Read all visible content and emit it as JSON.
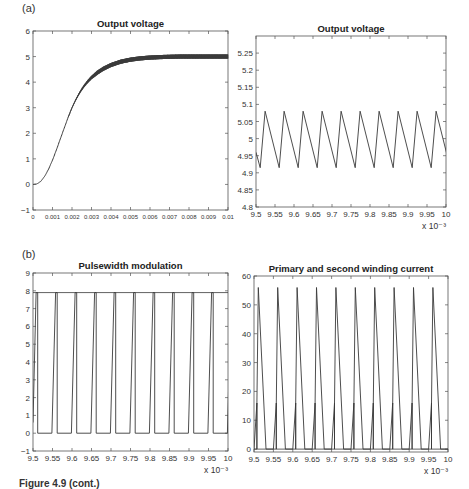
{
  "figure": {
    "panel_labels": [
      "(a)",
      "(b)"
    ],
    "caption": "Figure 4.9 (cont.)"
  },
  "chart_data": [
    {
      "id": "a-left",
      "type": "line",
      "title": "Output voltage",
      "xlabel": "",
      "ylabel": "",
      "xlim": [
        0,
        0.01
      ],
      "ylim": [
        -1,
        6
      ],
      "xticks": [
        0,
        0.001,
        0.002,
        0.003,
        0.004,
        0.005,
        0.006,
        0.007,
        0.008,
        0.009,
        0.01
      ],
      "xticklabels": [
        "0",
        "0.001",
        "0.002",
        "0.003",
        "0.004",
        "0.005",
        "0.006",
        "0.007",
        "0.008",
        "0.009",
        "0.01"
      ],
      "yticks": [
        -1,
        0,
        1,
        2,
        3,
        4,
        5,
        6
      ],
      "yticklabels": [
        "−1",
        "0",
        "1",
        "2",
        "3",
        "4",
        "5",
        "6"
      ],
      "x_exponent": "",
      "grid": false,
      "series": [
        {
          "name": "Output voltage",
          "x": [
            0,
            0.0002,
            0.0004,
            0.0006,
            0.0008,
            0.001,
            0.0012,
            0.0014,
            0.0016,
            0.0018,
            0.002,
            0.0022,
            0.0024,
            0.0026,
            0.0028,
            0.003,
            0.0033,
            0.0036,
            0.004,
            0.0045,
            0.005,
            0.0055,
            0.006,
            0.0065,
            0.007,
            0.0075,
            0.008,
            0.0085,
            0.009,
            0.0095,
            0.01
          ],
          "y": [
            0,
            0.02,
            0.12,
            0.32,
            0.6,
            0.95,
            1.35,
            1.78,
            2.2,
            2.62,
            3.0,
            3.32,
            3.6,
            3.83,
            4.02,
            4.18,
            4.37,
            4.52,
            4.67,
            4.8,
            4.88,
            4.93,
            4.96,
            4.98,
            4.99,
            5.0,
            5.0,
            5.0,
            5.0,
            5.0,
            5.0
          ],
          "ripple_band": 0.08
        }
      ]
    },
    {
      "id": "a-right",
      "type": "line",
      "title": "Output voltage",
      "xlim": [
        9.5,
        10
      ],
      "ylim": [
        4.8,
        5.3
      ],
      "xticks": [
        9.5,
        9.55,
        9.6,
        9.65,
        9.7,
        9.75,
        9.8,
        9.85,
        9.9,
        9.95,
        10
      ],
      "xticklabels": [
        "9.5",
        "9.55",
        "9.6",
        "9.65",
        "9.7",
        "9.75",
        "9.8",
        "9.85",
        "9.9",
        "9.95",
        "10"
      ],
      "yticks": [
        4.8,
        4.85,
        4.9,
        4.95,
        5,
        5.05,
        5.1,
        5.15,
        5.2,
        5.25
      ],
      "yticklabels": [
        "4.8",
        "4.85",
        "4.9",
        "4.95",
        "5",
        "5.05",
        "5.1",
        "5.15",
        "5.2",
        "5.25"
      ],
      "x_exponent": "x 10⁻³",
      "grid": false,
      "waveform": {
        "kind": "sawtooth",
        "period": 0.05,
        "min_x_offset": 0.011,
        "peak_x_offset": 0.024,
        "min": 4.915,
        "max": 5.08,
        "start_value": 4.96
      }
    },
    {
      "id": "b-left",
      "type": "line",
      "title": "Pulsewidth modulation",
      "xlim": [
        9.5,
        10
      ],
      "ylim": [
        -1,
        9
      ],
      "xticks": [
        9.5,
        9.55,
        9.6,
        9.65,
        9.7,
        9.75,
        9.8,
        9.85,
        9.9,
        9.95,
        10
      ],
      "xticklabels": [
        "9.5",
        "9.55",
        "9.6",
        "9.65",
        "9.7",
        "9.75",
        "9.8",
        "9.85",
        "9.9",
        "9.95",
        "10"
      ],
      "yticks": [
        -1,
        0,
        1,
        2,
        3,
        4,
        5,
        6,
        7,
        8,
        9
      ],
      "yticklabels": [
        "−1",
        "0",
        "1",
        "2",
        "3",
        "4",
        "5",
        "6",
        "7",
        "8",
        "9"
      ],
      "x_exponent": "x 10⁻³",
      "grid": false,
      "waveform": {
        "kind": "pwm",
        "period": 0.05,
        "high": 7.9,
        "low": 0,
        "rise_start_offset": 0.0105,
        "rise_end_offset": 0.0125,
        "fall_offset": 0.0,
        "first_edge": 9.5
      }
    },
    {
      "id": "b-right",
      "type": "line",
      "title": "Primary and second winding current",
      "xlim": [
        9.5,
        10
      ],
      "ylim": [
        -1,
        60
      ],
      "xticks": [
        9.5,
        9.55,
        9.6,
        9.65,
        9.7,
        9.75,
        9.8,
        9.85,
        9.9,
        9.95,
        10
      ],
      "xticklabels": [
        "9.5",
        "9.55",
        "9.6",
        "9.65",
        "9.7",
        "9.75",
        "9.8",
        "9.85",
        "9.9",
        "9.95",
        "10"
      ],
      "yticks": [
        0,
        10,
        20,
        30,
        40,
        50,
        60
      ],
      "yticklabels": [
        "0",
        "10",
        "20",
        "30",
        "40",
        "50",
        "60"
      ],
      "x_exponent": "x 10⁻³",
      "grid": false,
      "waveform": {
        "kind": "triangle-pulses",
        "period": 0.05,
        "peak": 56,
        "peak_offset": 0.011,
        "rise_start_offset": 0.0,
        "fall_end_offset": 0.031,
        "secondary_peak": 16,
        "secondary_offset": 0.0075
      }
    }
  ],
  "layout": {
    "axes": {
      "a-left": {
        "x0": 33,
        "y0": 31,
        "x1": 228,
        "y1": 210
      },
      "a-right": {
        "x0": 256,
        "y0": 36,
        "x1": 446,
        "y1": 207
      },
      "b-left": {
        "x0": 33,
        "y0": 273,
        "x1": 228,
        "y1": 451
      },
      "b-right": {
        "x0": 254,
        "y0": 276,
        "x1": 448,
        "y1": 452
      }
    },
    "line_color": "#3a3a3a",
    "axis_color": "#555555"
  }
}
